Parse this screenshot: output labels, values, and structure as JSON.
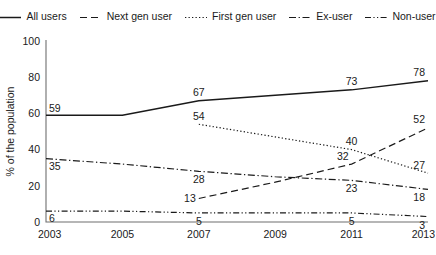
{
  "chart_data": {
    "type": "line",
    "title": "",
    "xlabel": "",
    "ylabel": "% of the population",
    "x": [
      2003,
      2005,
      2007,
      2009,
      2011,
      2013
    ],
    "categories": [
      "2003",
      "2005",
      "2007",
      "2009",
      "2011",
      "2013"
    ],
    "xlim": [
      2003,
      2013
    ],
    "ylim": [
      0,
      100
    ],
    "yticks": [
      0,
      20,
      40,
      60,
      80,
      100
    ],
    "ytick_labels": [
      "0",
      "20",
      "40",
      "60",
      "80",
      "100"
    ],
    "grid": false,
    "legend_position": "top",
    "series": [
      {
        "name": "All users",
        "style": "solid",
        "x": [
          2003,
          2005,
          2007,
          2009,
          2011,
          2013
        ],
        "values": [
          59,
          59,
          67,
          70,
          73,
          78
        ],
        "labels": [
          {
            "x": 2003,
            "y": 59,
            "text": "59",
            "pos": "above-right"
          },
          {
            "x": 2007,
            "y": 67,
            "text": "67",
            "pos": "above"
          },
          {
            "x": 2011,
            "y": 73,
            "text": "73",
            "pos": "above"
          },
          {
            "x": 2013,
            "y": 78,
            "text": "78",
            "pos": "above-left"
          }
        ]
      },
      {
        "name": "Next gen user",
        "style": "dashed",
        "x": [
          2007,
          2009,
          2011,
          2013
        ],
        "values": [
          13,
          22,
          32,
          52
        ],
        "labels": [
          {
            "x": 2007,
            "y": 13,
            "text": "13",
            "pos": "left"
          },
          {
            "x": 2011,
            "y": 32,
            "text": "32",
            "pos": "above-left"
          },
          {
            "x": 2013,
            "y": 52,
            "text": "52",
            "pos": "above-left"
          }
        ]
      },
      {
        "name": "First gen user",
        "style": "dotted",
        "x": [
          2007,
          2009,
          2011,
          2013
        ],
        "values": [
          54,
          47,
          40,
          27
        ],
        "labels": [
          {
            "x": 2007,
            "y": 54,
            "text": "54",
            "pos": "above"
          },
          {
            "x": 2011,
            "y": 40,
            "text": "40",
            "pos": "above"
          },
          {
            "x": 2013,
            "y": 27,
            "text": "27",
            "pos": "above-left"
          }
        ]
      },
      {
        "name": "Ex-user",
        "style": "dash-dot",
        "x": [
          2003,
          2005,
          2007,
          2009,
          2011,
          2013
        ],
        "values": [
          35,
          32,
          28,
          25,
          23,
          18
        ],
        "labels": [
          {
            "x": 2003,
            "y": 35,
            "text": "35",
            "pos": "below-right"
          },
          {
            "x": 2007,
            "y": 28,
            "text": "28",
            "pos": "below"
          },
          {
            "x": 2011,
            "y": 23,
            "text": "23",
            "pos": "below"
          },
          {
            "x": 2013,
            "y": 18,
            "text": "18",
            "pos": "below-left"
          }
        ]
      },
      {
        "name": "Non-user",
        "style": "dash-dot-dot",
        "x": [
          2003,
          2005,
          2007,
          2009,
          2011,
          2013
        ],
        "values": [
          6,
          6,
          5,
          5,
          5,
          3
        ],
        "labels": [
          {
            "x": 2003,
            "y": 6,
            "text": "6",
            "pos": "below-right"
          },
          {
            "x": 2007,
            "y": 5,
            "text": "5",
            "pos": "below"
          },
          {
            "x": 2011,
            "y": 5,
            "text": "5",
            "pos": "below"
          },
          {
            "x": 2013,
            "y": 3,
            "text": "3",
            "pos": "below-left"
          }
        ]
      }
    ]
  },
  "legend": {
    "items": [
      {
        "label": "All users",
        "style": "solid"
      },
      {
        "label": "Next gen user",
        "style": "dashed"
      },
      {
        "label": "First gen user",
        "style": "dotted"
      },
      {
        "label": "Ex-user",
        "style": "dash-dot"
      },
      {
        "label": "Non-user",
        "style": "dash-dot-dot"
      }
    ]
  },
  "colors": {
    "line": "#1a1a1a",
    "axis": "#6f6f6f",
    "background": "#ffffff"
  }
}
